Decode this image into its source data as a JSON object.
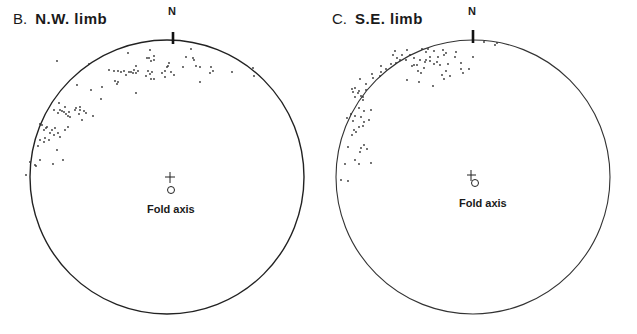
{
  "figure": {
    "panels": [
      {
        "id": "B",
        "letter": "B.",
        "name": "N.W. limb",
        "north_label": "N",
        "fold_axis_label": "Fold axis",
        "net": {
          "cx": 167,
          "cy": 177,
          "r": 140
        },
        "center_cross": {
          "x": 170,
          "y": 177
        },
        "fold_axis": {
          "x": 171,
          "y": 190
        },
        "points": [
          [
            57,
            61
          ],
          [
            89,
            64
          ],
          [
            128,
            53
          ],
          [
            150,
            50
          ],
          [
            149,
            58
          ],
          [
            147,
            58
          ],
          [
            151,
            61
          ],
          [
            154,
            60
          ],
          [
            191,
            49
          ],
          [
            193,
            58
          ],
          [
            186,
            57
          ],
          [
            154,
            56
          ],
          [
            183,
            67
          ],
          [
            167,
            67
          ],
          [
            169,
            63
          ],
          [
            168,
            66
          ],
          [
            148,
            71
          ],
          [
            152,
            72
          ],
          [
            146,
            76
          ],
          [
            151,
            79
          ],
          [
            150,
            74
          ],
          [
            138,
            71
          ],
          [
            136,
            66
          ],
          [
            134,
            70
          ],
          [
            124,
            71
          ],
          [
            129,
            72
          ],
          [
            118,
            71
          ],
          [
            114,
            71
          ],
          [
            109,
            70
          ],
          [
            126,
            75
          ],
          [
            121,
            72
          ],
          [
            133,
            73
          ],
          [
            131,
            72
          ],
          [
            136,
            73
          ],
          [
            118,
            82
          ],
          [
            117,
            84
          ],
          [
            115,
            81
          ],
          [
            162,
            73
          ],
          [
            165,
            71
          ],
          [
            171,
            72
          ],
          [
            174,
            75
          ],
          [
            165,
            77
          ],
          [
            194,
            60
          ],
          [
            196,
            66
          ],
          [
            200,
            67
          ],
          [
            211,
            67
          ],
          [
            213,
            71
          ],
          [
            210,
            73
          ],
          [
            232,
            72
          ],
          [
            253,
            68
          ],
          [
            254,
            76
          ],
          [
            200,
            82
          ],
          [
            154,
            79
          ],
          [
            136,
            93
          ],
          [
            102,
            87
          ],
          [
            91,
            90
          ],
          [
            77,
            85
          ],
          [
            101,
            99
          ],
          [
            76,
            108
          ],
          [
            80,
            107
          ],
          [
            84,
            111
          ],
          [
            86,
            113
          ],
          [
            93,
            116
          ],
          [
            82,
            120
          ],
          [
            58,
            113
          ],
          [
            60,
            110
          ],
          [
            62,
            111
          ],
          [
            64,
            112
          ],
          [
            66,
            114
          ],
          [
            68,
            116
          ],
          [
            70,
            117
          ],
          [
            69,
            112
          ],
          [
            75,
            110
          ],
          [
            79,
            114
          ],
          [
            80,
            110
          ],
          [
            59,
            103
          ],
          [
            65,
            107
          ],
          [
            54,
            110
          ],
          [
            46,
            128
          ],
          [
            42,
            125
          ],
          [
            40,
            124
          ],
          [
            44,
            130
          ],
          [
            47,
            127
          ],
          [
            50,
            133
          ],
          [
            52,
            130
          ],
          [
            55,
            128
          ],
          [
            45,
            138
          ],
          [
            49,
            140
          ],
          [
            54,
            135
          ],
          [
            58,
            133
          ],
          [
            60,
            137
          ],
          [
            65,
            130
          ],
          [
            68,
            127
          ],
          [
            44,
            142
          ],
          [
            40,
            140
          ],
          [
            38,
            146
          ],
          [
            57,
            150
          ],
          [
            63,
            160
          ],
          [
            36,
            166
          ],
          [
            30,
            162
          ],
          [
            35,
            165
          ],
          [
            26,
            175
          ],
          [
            53,
            164
          ],
          [
            40,
            160
          ]
        ]
      },
      {
        "id": "C",
        "letter": "C.",
        "name": "S.E. limb",
        "north_label": "N",
        "fold_axis_label": "Fold axis",
        "net": {
          "cx": 155,
          "cy": 177,
          "r": 140
        },
        "center_cross": {
          "x": 153,
          "y": 175
        },
        "fold_axis": {
          "x": 157,
          "y": 183
        },
        "points": [
          [
            166,
            42
          ],
          [
            177,
            45
          ],
          [
            179,
            43
          ],
          [
            138,
            52
          ],
          [
            155,
            57
          ],
          [
            130,
            64
          ],
          [
            128,
            71
          ],
          [
            124,
            75
          ],
          [
            132,
            76
          ],
          [
            122,
            65
          ],
          [
            106,
            68
          ],
          [
            107,
            62
          ],
          [
            99,
            65
          ],
          [
            96,
            65
          ],
          [
            112,
            57
          ],
          [
            112,
            61
          ],
          [
            116,
            51
          ],
          [
            125,
            50
          ],
          [
            126,
            55
          ],
          [
            128,
            53
          ],
          [
            120,
            57
          ],
          [
            119,
            62
          ],
          [
            108,
            60
          ],
          [
            102,
            60
          ],
          [
            104,
            49
          ],
          [
            108,
            52
          ],
          [
            110,
            49
          ],
          [
            116,
            64
          ],
          [
            103,
            73
          ],
          [
            100,
            71
          ],
          [
            94,
            66
          ],
          [
            96,
            58
          ],
          [
            78,
            63
          ],
          [
            75,
            55
          ],
          [
            82,
            60
          ],
          [
            84,
            55
          ],
          [
            89,
            50
          ],
          [
            92,
            55
          ],
          [
            88,
            60
          ],
          [
            79,
            58
          ],
          [
            77,
            51
          ],
          [
            101,
            82
          ],
          [
            115,
            86
          ],
          [
            143,
            63
          ],
          [
            143,
            69
          ],
          [
            151,
            69
          ],
          [
            145,
            73
          ],
          [
            137,
            57
          ],
          [
            126,
            79
          ],
          [
            89,
            80
          ],
          [
            63,
            66
          ],
          [
            73,
            64
          ],
          [
            68,
            69
          ],
          [
            63,
            72
          ],
          [
            62,
            76
          ],
          [
            54,
            74
          ],
          [
            55,
            78
          ],
          [
            48,
            84
          ],
          [
            42,
            79
          ],
          [
            37,
            88
          ],
          [
            35,
            92
          ],
          [
            40,
            93
          ],
          [
            43,
            96
          ],
          [
            45,
            97
          ],
          [
            37,
            97
          ],
          [
            34,
            89
          ],
          [
            48,
            90
          ],
          [
            41,
            91
          ],
          [
            45,
            100
          ],
          [
            41,
            108
          ],
          [
            46,
            111
          ],
          [
            53,
            110
          ],
          [
            35,
            121
          ],
          [
            33,
            114
          ],
          [
            37,
            116
          ],
          [
            29,
            118
          ],
          [
            43,
            117
          ],
          [
            51,
            120
          ],
          [
            45,
            126
          ],
          [
            38,
            132
          ],
          [
            34,
            135
          ],
          [
            36,
            130
          ],
          [
            41,
            127
          ],
          [
            46,
            122
          ],
          [
            43,
            148
          ],
          [
            46,
            145
          ],
          [
            37,
            160
          ],
          [
            42,
            152
          ],
          [
            49,
            149
          ],
          [
            41,
            164
          ],
          [
            30,
            147
          ],
          [
            27,
            164
          ],
          [
            23,
            180
          ],
          [
            30,
            181
          ],
          [
            53,
            163
          ]
        ]
      }
    ]
  }
}
